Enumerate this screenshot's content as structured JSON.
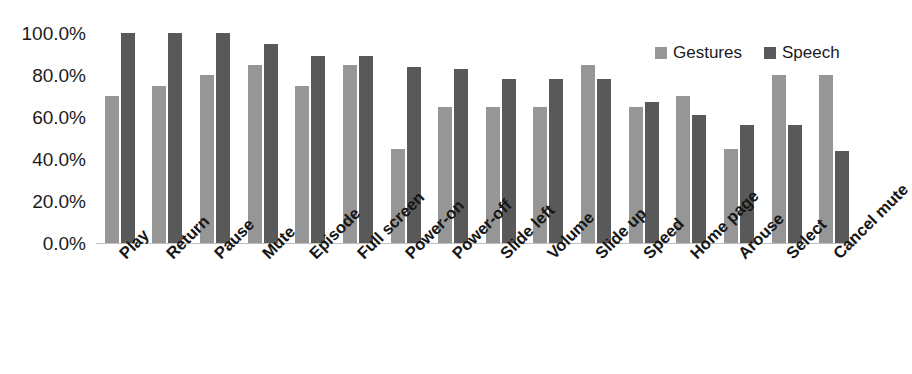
{
  "chart_data": {
    "type": "bar",
    "title": "",
    "xlabel": "",
    "ylabel": "",
    "ylim": [
      0,
      100
    ],
    "grid": false,
    "legend_position": "top-right",
    "categories": [
      "Play",
      "Return",
      "Pause",
      "Mute",
      "Episode",
      "Full screen",
      "Power-on",
      "Power-off",
      "Slide left",
      "Volume",
      "Slide up",
      "Speed",
      "Home page",
      "Arouse",
      "Select",
      "Cancel mute"
    ],
    "series": [
      {
        "name": "Gestures",
        "color": "#969696",
        "values": [
          70,
          75,
          80,
          85,
          75,
          85,
          45,
          65,
          65,
          65,
          85,
          65,
          70,
          45,
          80,
          80
        ]
      },
      {
        "name": "Speech",
        "color": "#595959",
        "values": [
          100,
          100,
          100,
          95,
          89,
          89,
          84,
          83,
          78,
          78,
          78,
          67,
          61,
          56,
          56,
          44
        ]
      }
    ],
    "y_ticks": [
      {
        "value": 100,
        "label": "100.0%"
      },
      {
        "value": 80,
        "label": "80.0%"
      },
      {
        "value": 60,
        "label": "60.0%"
      },
      {
        "value": 40,
        "label": "40.0%"
      },
      {
        "value": 20,
        "label": "20.0%"
      },
      {
        "value": 0,
        "label": "0.0%"
      }
    ]
  },
  "legend": {
    "entries": [
      {
        "label": "Gestures",
        "color": "#969696"
      },
      {
        "label": "Speech",
        "color": "#595959"
      }
    ]
  },
  "colors": {
    "gestures": "#969696",
    "speech": "#595959",
    "axis": "#bfbfbf",
    "text": "#1b1b1b",
    "background": "#ffffff"
  }
}
